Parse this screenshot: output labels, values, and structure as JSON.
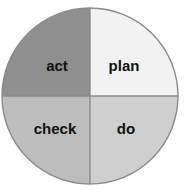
{
  "diagram": {
    "name": "pdca-cycle",
    "background_color": "#ffffff",
    "outline_color": "#8a8a8a",
    "divider_color": "#8a8a8a",
    "label_color": "#111111",
    "circle": {
      "center_x": 90,
      "center_y": 96,
      "radius": 88
    },
    "quadrants": [
      {
        "key": "act",
        "label": "act",
        "position": "top-left",
        "fill": "#8f8f8f",
        "label_x": 57,
        "label_y": 67
      },
      {
        "key": "plan",
        "label": "plan",
        "position": "top-right",
        "fill": "#f2f2f2",
        "label_x": 124,
        "label_y": 67
      },
      {
        "key": "check",
        "label": "check",
        "position": "bottom-left",
        "fill": "#bdbdbd",
        "label_x": 55,
        "label_y": 130
      },
      {
        "key": "do",
        "label": "do",
        "position": "bottom-right",
        "fill": "#cfcfcf",
        "label_x": 126,
        "label_y": 130
      }
    ]
  }
}
